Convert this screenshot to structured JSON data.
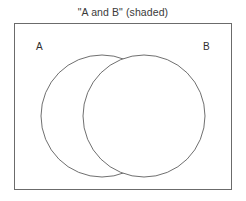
{
  "canvas": {
    "width": 246,
    "height": 201,
    "background": "#ffffff"
  },
  "diagram": {
    "type": "venn-two-set",
    "title": "\"A and B\" (shaded)",
    "shaded_region": "intersection",
    "shaded_color": "#d4d4d4",
    "outline_color": "#5f5f5f",
    "universe_border_color": "#6b6b6b",
    "circle_fill": "#ffffff",
    "title_color": "#3a3a3a"
  },
  "universe": {
    "label": "",
    "x": 14,
    "y": 23,
    "width": 218,
    "height": 167
  },
  "sets": [
    {
      "label": "A",
      "label_x": 36,
      "label_y": 50,
      "center_x": 102,
      "center_y": 116,
      "radius": 61
    },
    {
      "label": "B",
      "label_x": 203,
      "label_y": 50,
      "center_x": 144,
      "center_y": 116,
      "radius": 61
    }
  ],
  "intersection": {
    "name": "A and B",
    "top_x": 123,
    "top_y": 61,
    "bottom_x": 123,
    "bottom_y": 170,
    "left_extent_x": 95,
    "right_extent_x": 152
  }
}
